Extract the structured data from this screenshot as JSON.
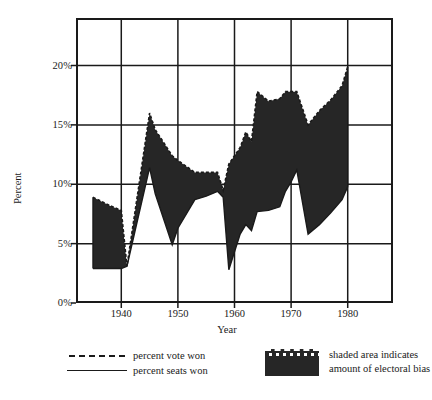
{
  "chart_data": {
    "type": "area",
    "title": "",
    "subtitle": "",
    "xlabel": "Year",
    "ylabel": "Percent",
    "xlim": [
      1932,
      1988
    ],
    "ylim": [
      0,
      24
    ],
    "grid": true,
    "grid_x_values": [
      1940,
      1950,
      1960,
      1970,
      1980
    ],
    "grid_y_values": [
      5,
      10,
      15,
      20
    ],
    "x_tick_labels": [
      "1940",
      "1950",
      "1960",
      "1970",
      "1980"
    ],
    "y_tick_labels": [
      "0%",
      "5%",
      "10%",
      "15%",
      "20%"
    ],
    "y_tick_values": [
      0,
      5,
      10,
      15,
      20
    ],
    "legend_position": "below-plot",
    "shade_color": "#262626",
    "line_color": "#1a1a1a",
    "annotation": "shaded area indicates amount of electoral bias",
    "series": [
      {
        "name": "percent vote won",
        "style": "dashed",
        "x": [
          1935,
          1938,
          1940,
          1941,
          1945,
          1946,
          1949,
          1950,
          1953,
          1955,
          1957,
          1958,
          1959,
          1961,
          1962,
          1963,
          1964,
          1966,
          1968,
          1969,
          1970,
          1971,
          1973,
          1975,
          1977,
          1979,
          1980
        ],
        "values": [
          8.9,
          8.2,
          7.8,
          3.1,
          16.0,
          14.6,
          12.4,
          12.0,
          11.0,
          11.0,
          11.0,
          9.5,
          11.7,
          13.1,
          14.4,
          13.6,
          17.8,
          17.0,
          17.2,
          17.8,
          17.8,
          17.8,
          15.0,
          16.2,
          17.1,
          18.3,
          19.9
        ]
      },
      {
        "name": "percent seats won",
        "style": "solid",
        "x": [
          1935,
          1938,
          1940,
          1941,
          1945,
          1946,
          1949,
          1950,
          1953,
          1955,
          1957,
          1958,
          1959,
          1961,
          1962,
          1963,
          1964,
          1966,
          1968,
          1969,
          1970,
          1971,
          1973,
          1975,
          1977,
          1979,
          1980
        ],
        "values": [
          2.9,
          2.9,
          2.9,
          3.1,
          11.4,
          9.2,
          4.9,
          6.3,
          8.7,
          9.0,
          9.4,
          8.9,
          2.8,
          5.8,
          6.6,
          6.1,
          7.7,
          7.8,
          8.1,
          9.4,
          10.2,
          11.2,
          5.8,
          6.6,
          7.6,
          8.7,
          9.8
        ]
      }
    ]
  },
  "axes": {
    "y_label": "Percent",
    "x_label": "Year",
    "x_ticks": [
      "1940",
      "1950",
      "1960",
      "1970",
      "1980"
    ],
    "y_ticks": [
      "0%",
      "5%",
      "10%",
      "15%",
      "20%"
    ]
  },
  "legend": {
    "vote_label": "percent vote won",
    "seats_label": "percent seats won",
    "shaded_line_1": "shaded area indicates",
    "shaded_line_2": "amount of electoral bias"
  },
  "colors": {
    "shade": "#262626",
    "ink": "#1a1a1a",
    "background": "#ffffff"
  }
}
